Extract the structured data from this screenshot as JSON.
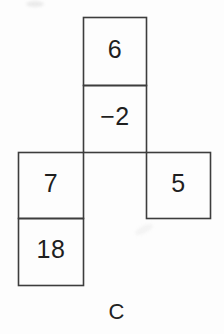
{
  "puzzle": {
    "label": "C",
    "ink_color": "#1f1f1f",
    "line_color": "#3d3d3d",
    "background_color": "#fdfdfd",
    "cells": [
      {
        "position": "top",
        "value": "6"
      },
      {
        "position": "middle",
        "value": "−2"
      },
      {
        "position": "left",
        "value": "7"
      },
      {
        "position": "right",
        "value": "5"
      },
      {
        "position": "bottom-left",
        "value": "18"
      }
    ]
  }
}
